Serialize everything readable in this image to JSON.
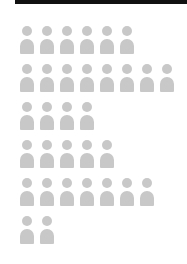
{
  "chart_data": {
    "type": "pictogram",
    "title": "",
    "categories": [
      "Row 1",
      "Row 2",
      "Row 3",
      "Row 4",
      "Row 5",
      "Row 6"
    ],
    "values": [
      6,
      8,
      4,
      5,
      7,
      2
    ],
    "icon": "person-icon",
    "icon_color": "#c8c8c8",
    "legend": [],
    "xlabel": "",
    "ylabel": ""
  },
  "header": {
    "bar_color": "#111111"
  }
}
